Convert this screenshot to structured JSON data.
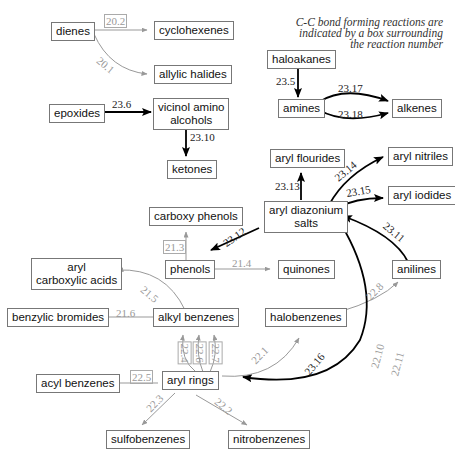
{
  "note": {
    "line1": "C-C bond forming reactions are",
    "line2": "indicated by a box surrounding",
    "line3": "the reaction number"
  },
  "nodes": {
    "dienes": "dienes",
    "cyclohexenes": "cyclohexenes",
    "allylic_halides": "allylic halides",
    "haloakanes": "haloakanes",
    "amines": "amines",
    "alkenes": "alkenes",
    "epoxides": "epoxides",
    "vicinol_amino_alcohols_1": "vicinol amino",
    "vicinol_amino_alcohols_2": "alcohols",
    "ketones": "ketones",
    "aryl_flourides": "aryl flourides",
    "aryl_nitriles": "aryl nitriles",
    "aryl_iodides": "aryl iodides",
    "aryl_diazonium_1": "aryl diazonium",
    "aryl_diazonium_2": "salts",
    "carboxy_phenols": "carboxy phenols",
    "phenols": "phenols",
    "quinones": "quinones",
    "anilines": "anilines",
    "aryl_carboxylic_acids_1": "aryl",
    "aryl_carboxylic_acids_2": "carboxylic acids",
    "benzylic_bromides": "benzylic bromides",
    "alkyl_benzenes": "alkyl benzenes",
    "halobenzenes": "halobenzenes",
    "acyl_benzenes": "acyl benzenes",
    "aryl_rings": "aryl rings",
    "sulfobenzenes": "sulfobenzenes",
    "nitrobenzenes": "nitrobenzenes"
  },
  "reactions": {
    "r20_2": "20.2",
    "r20_1": "20.1",
    "r23_5": "23.5",
    "r23_17": "23.17",
    "r23_18": "23.18",
    "r23_6": "23.6",
    "r23_10": "23.10",
    "r23_13": "23.13",
    "r23_14": "23.14",
    "r23_15": "23.15",
    "r23_11": "23.11",
    "r23_12": "23.12",
    "r21_3": "21.3",
    "r21_4": "21.4",
    "r21_5": "21.5",
    "r21_6": "21.6",
    "r22_8": "22.8",
    "r22_1": "22.1",
    "r22_4": "22.4",
    "r22_6": "22.6",
    "r22_7": "22.7",
    "r22_5": "22.5",
    "r22_3": "22.3",
    "r22_2": "22.2",
    "r23_16": "23.16",
    "r22_10": "22.10",
    "r22_11": "22.11"
  },
  "colors": {
    "primary_arrow": "#000000",
    "secondary_arrow": "#999999"
  }
}
